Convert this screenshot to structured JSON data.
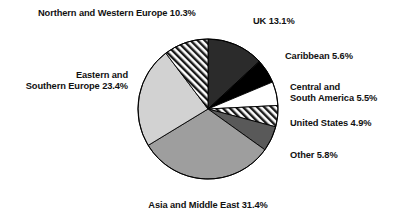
{
  "chart_data": {
    "type": "pie",
    "title": "",
    "subtitle": "",
    "xlabel": "",
    "ylabel": "",
    "units": "percent",
    "legend_position": "none",
    "grid": false,
    "labels_mode": "outside-direct",
    "start_angle_deg": 0,
    "direction": "clockwise",
    "categories": [
      "UK",
      "Caribbean",
      "Central and South America",
      "United States",
      "Other",
      "Asia and Middle East",
      "Eastern and Southern Europe",
      "Northern and Western Europe"
    ],
    "values": [
      13.1,
      5.6,
      5.5,
      4.9,
      5.8,
      31.4,
      23.4,
      10.3
    ],
    "slices": [
      {
        "name": "UK",
        "value": 13.1,
        "label": "UK 13.1%",
        "fill": "#2b2b2b",
        "pattern": "solid",
        "stroke": "#000000"
      },
      {
        "name": "Caribbean",
        "value": 5.6,
        "label": "Caribbean 5.6%",
        "fill": "#000000",
        "pattern": "solid",
        "stroke": "#000000"
      },
      {
        "name": "Central and South America",
        "value": 5.5,
        "label": "Central and\nSouth America 5.5%",
        "fill": "#ffffff",
        "pattern": "solid",
        "stroke": "#000000"
      },
      {
        "name": "United States",
        "value": 4.9,
        "label": "United States 4.9%",
        "fill": "#ffffff",
        "pattern": "diagonal-hatch",
        "stroke": "#000000"
      },
      {
        "name": "Other",
        "value": 5.8,
        "label": "Other 5.8%",
        "fill": "#595959",
        "pattern": "solid",
        "stroke": "#000000"
      },
      {
        "name": "Asia and Middle East",
        "value": 31.4,
        "label": "Asia and Middle East 31.4%",
        "fill": "#9e9e9e",
        "pattern": "solid",
        "stroke": "#000000"
      },
      {
        "name": "Eastern and Southern Europe",
        "value": 23.4,
        "label": "Eastern and\nSouthern Europe 23.4%",
        "fill": "#d2d2d2",
        "pattern": "solid",
        "stroke": "#000000"
      },
      {
        "name": "Northern and Western Europe",
        "value": 10.3,
        "label": "Northern and Western Europe 10.3%",
        "fill": "#ffffff",
        "pattern": "diagonal-hatch",
        "stroke": "#000000"
      }
    ]
  },
  "labels": {
    "uk": "UK 13.1%",
    "caribbean": "Caribbean 5.6%",
    "central_south_america": "Central and\nSouth America 5.5%",
    "united_states": "United States 4.9%",
    "other": "Other 5.8%",
    "asia_middle_east": "Asia and Middle East 31.4%",
    "eastern_southern_europe": "Eastern and\nSouthern Europe 23.4%",
    "northern_western_europe": "Northern and Western Europe 10.3%"
  },
  "colors": {
    "background": "#ffffff",
    "text": "#111111",
    "outline": "#000000",
    "uk": "#2b2b2b",
    "caribbean": "#000000",
    "central_south_america": "#ffffff",
    "united_states_hatch": "#ffffff",
    "other": "#595959",
    "asia_middle_east": "#9e9e9e",
    "eastern_southern_europe": "#d2d2d2",
    "northern_western_europe_hatch": "#ffffff"
  },
  "geometry": {
    "center_x": 208,
    "center_y": 109,
    "radius": 70
  }
}
